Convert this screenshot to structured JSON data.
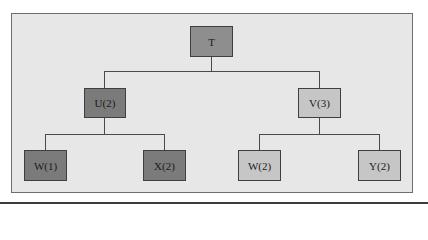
{
  "diagram": {
    "type": "tree",
    "colors": {
      "background": "#e7e7e7",
      "root": "#8e8e8e",
      "left_subtree": "#7b7b7b",
      "right_subtree": "#c6c6c6",
      "border": "#3f3f3f"
    },
    "root": {
      "label": "T"
    },
    "level1": [
      {
        "label": "U(2)",
        "shade": "dark"
      },
      {
        "label": "V(3)",
        "shade": "light"
      }
    ],
    "level2": [
      {
        "label": "W(1)",
        "parent": "U(2)",
        "shade": "dark"
      },
      {
        "label": "X(2)",
        "parent": "U(2)",
        "shade": "dark"
      },
      {
        "label": "W(2)",
        "parent": "V(3)",
        "shade": "light"
      },
      {
        "label": "Y(2)",
        "parent": "V(3)",
        "shade": "light"
      }
    ]
  }
}
